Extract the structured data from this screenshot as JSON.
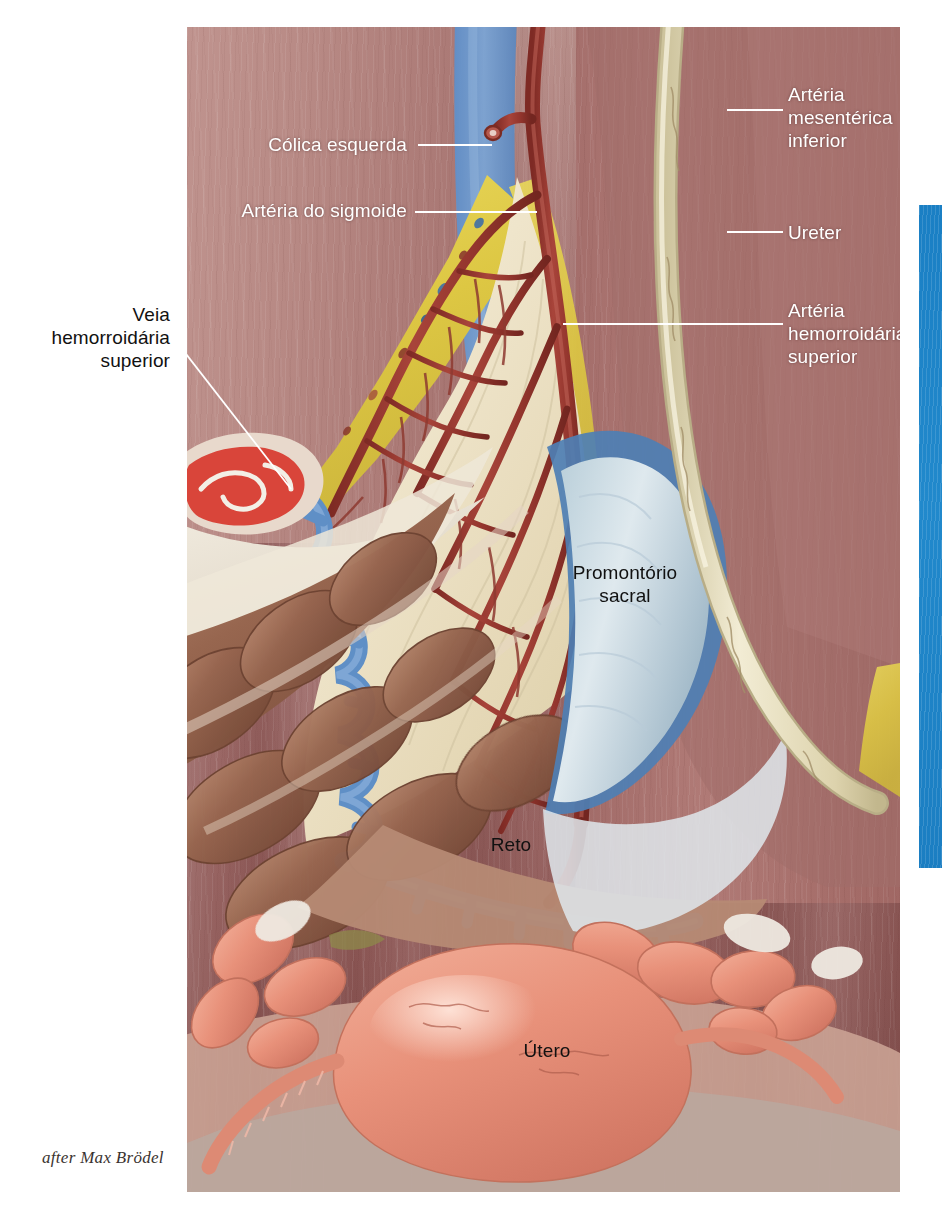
{
  "figure": {
    "attribution": "after Max Brödel",
    "accent_blue": "#1c82c6",
    "labels_left": [
      {
        "id": "colica-esquerda",
        "text": "Cólica esquerda",
        "color": "#ffffff"
      },
      {
        "id": "arteria-do-sigmoide",
        "text": "Artéria do sigmoide",
        "color": "#ffffff"
      }
    ],
    "labels_outside_left": [
      {
        "id": "veia-hemorroidaria-superior",
        "line1": "Veia",
        "line2": "hemorroidária",
        "line3": "superior",
        "color": "#111111"
      }
    ],
    "labels_right": [
      {
        "id": "arteria-mesenterica-inferior",
        "line1": "Artéria",
        "line2": "mesentérica",
        "line3": "inferior",
        "color": "#ffffff"
      },
      {
        "id": "ureter",
        "line1": "Ureter",
        "line2": "",
        "line3": "",
        "color": "#ffffff"
      },
      {
        "id": "arteria-hemorroidaria-superior",
        "line1": "Artéria",
        "line2": "hemorroidária",
        "line3": "superior",
        "color": "#ffffff"
      }
    ],
    "labels_inline": [
      {
        "id": "promontorio-sacral",
        "line1": "Promontório",
        "line2": "sacral",
        "color": "#111111"
      },
      {
        "id": "reto",
        "line1": "Reto",
        "line2": "",
        "color": "#111111"
      },
      {
        "id": "utero",
        "line1": "Útero",
        "line2": "",
        "color": "#111111"
      }
    ],
    "palette": {
      "artery_red": "#9e3b32",
      "vein_blue": "#5d8cc4",
      "fat_yellow": "#e3cf4e",
      "mesentery_cream": "#efe6d2",
      "ureter_cream": "#e9e2c4",
      "bowel_brown": "#8d6152",
      "uterus_pink": "#e8937e",
      "sacrum_blue": "#9fb9cb",
      "muscle_mauve": "#ad7c78"
    }
  }
}
